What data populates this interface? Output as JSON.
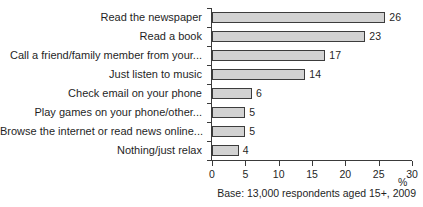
{
  "chart_data": {
    "type": "bar",
    "orientation": "horizontal",
    "title": "",
    "subtitle": "",
    "xlabel": "%",
    "ylabel": "",
    "xlim": [
      0,
      30
    ],
    "xticks": [
      0,
      5,
      10,
      15,
      20,
      25,
      30
    ],
    "grid": false,
    "legend": null,
    "categories": [
      "Read the newspaper",
      "Read a book",
      "Call a friend/family member from your...",
      "Just listen to music",
      "Check email on your phone",
      "Play games on your phone/other...",
      "Browse the internet or read news online...",
      "Nothing/just relax"
    ],
    "values": [
      26,
      23,
      17,
      14,
      6,
      5,
      5,
      4
    ],
    "value_labels": [
      "26",
      "23",
      "17",
      "14",
      "6",
      "5",
      "5",
      "4"
    ],
    "annotations": [
      "Base: 13,000 respondents aged 15+, 2009"
    ],
    "bar_fill_color": "#d2d2d2",
    "bar_border_color": "#3c3c3c",
    "axis_color": "#3a3a3a",
    "text_color": "#1f1f1f"
  },
  "footnote": {
    "base_note": "Base: 13,000 respondents aged 15+, 2009"
  },
  "axis": {
    "unit_label": "%",
    "tick_labels": [
      "0",
      "5",
      "10",
      "15",
      "20",
      "25",
      "30"
    ]
  }
}
